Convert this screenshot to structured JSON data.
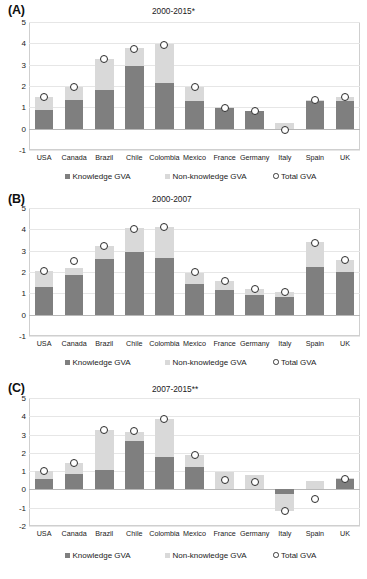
{
  "figure": {
    "panels": [
      {
        "letter": "(A)",
        "title": "2000-2015*",
        "y_ticks": [
          "5",
          "4",
          "3",
          "2",
          "1",
          "0",
          "-1"
        ],
        "ylim": [
          -1,
          5
        ],
        "legend": [
          {
            "label": "Knowledge GVA",
            "swatch": "knowledge",
            "color": "#7f7f7f"
          },
          {
            "label": "Non-knowledge GVA",
            "swatch": "nonknowledge",
            "color": "#d9d9d9"
          },
          {
            "label": "Total GVA",
            "swatch": "total",
            "color": "#ffffff"
          }
        ]
      },
      {
        "letter": "(B)",
        "title": "2000-2007",
        "y_ticks": [
          "5",
          "4",
          "3",
          "2",
          "1",
          "0",
          "-1"
        ],
        "ylim": [
          -1,
          5
        ],
        "legend": [
          {
            "label": "Knowledge GVA",
            "swatch": "knowledge",
            "color": "#7f7f7f"
          },
          {
            "label": "Non-knowledge GVA",
            "swatch": "nonknowledge",
            "color": "#d9d9d9"
          },
          {
            "label": "Total GVA",
            "swatch": "total",
            "color": "#ffffff"
          }
        ]
      },
      {
        "letter": "(C)",
        "title": "2007-2015**",
        "y_ticks": [
          "5",
          "4",
          "3",
          "2",
          "1",
          "0",
          "-1",
          "-2"
        ],
        "ylim": [
          -2,
          5
        ],
        "legend": [
          {
            "label": "Knowledge GVA",
            "swatch": "knowledge",
            "color": "#7f7f7f"
          },
          {
            "label": "Non-knowledge GVA",
            "swatch": "nonknowledge",
            "color": "#d9d9d9"
          },
          {
            "label": "Total GVA",
            "swatch": "total",
            "color": "#ffffff"
          }
        ]
      }
    ]
  },
  "chart_data": [
    {
      "type": "bar",
      "title": "2000-2015*",
      "panel": "(A)",
      "xlabel": "",
      "ylabel": "",
      "ylim": [
        -1,
        5
      ],
      "yticks": [
        -1,
        0,
        1,
        2,
        3,
        4,
        5
      ],
      "grid": true,
      "stacked": true,
      "legend_position": "bottom",
      "categories": [
        "USA",
        "Canada",
        "Brazil",
        "Chile",
        "Colombia",
        "Mexico",
        "France",
        "Germany",
        "Italy",
        "Spain",
        "UK"
      ],
      "series": [
        {
          "name": "Knowledge GVA",
          "color": "#7f7f7f",
          "values": [
            0.87,
            1.33,
            1.79,
            2.94,
            2.12,
            1.32,
            0.97,
            0.82,
            0.0,
            1.31,
            1.3
          ]
        },
        {
          "name": "Non-knowledge GVA",
          "color": "#d9d9d9",
          "values": [
            0.62,
            0.62,
            1.48,
            0.83,
            1.84,
            0.63,
            0.03,
            0.0,
            0.25,
            0.03,
            0.18
          ]
        },
        {
          "name": "Total GVA",
          "color": "#ffffff",
          "type": "scatter",
          "marker": "circle",
          "values": [
            1.48,
            1.95,
            3.27,
            3.75,
            3.94,
            1.96,
            0.95,
            0.82,
            -0.08,
            1.35,
            1.47
          ]
        }
      ]
    },
    {
      "type": "bar",
      "title": "2000-2007",
      "panel": "(B)",
      "xlabel": "",
      "ylabel": "",
      "ylim": [
        -1,
        5
      ],
      "yticks": [
        -1,
        0,
        1,
        2,
        3,
        4,
        5
      ],
      "grid": true,
      "stacked": true,
      "legend_position": "bottom",
      "categories": [
        "USA",
        "Canada",
        "Brazil",
        "Chile",
        "Colombia",
        "Mexico",
        "France",
        "Germany",
        "Italy",
        "Spain",
        "UK"
      ],
      "series": [
        {
          "name": "Knowledge GVA",
          "color": "#7f7f7f",
          "values": [
            1.3,
            1.86,
            2.59,
            2.96,
            2.64,
            1.44,
            1.17,
            0.93,
            0.85,
            2.23,
            1.99
          ]
        },
        {
          "name": "Non-knowledge GVA",
          "color": "#d9d9d9",
          "values": [
            0.75,
            0.35,
            0.62,
            1.09,
            1.45,
            0.52,
            0.4,
            0.27,
            0.2,
            1.18,
            0.56
          ]
        },
        {
          "name": "Total GVA",
          "color": "#ffffff",
          "type": "scatter",
          "marker": "circle",
          "values": [
            2.05,
            2.5,
            3.23,
            4.0,
            4.1,
            2.0,
            1.58,
            1.22,
            1.08,
            3.38,
            2.55
          ]
        }
      ]
    },
    {
      "type": "bar",
      "title": "2007-2015**",
      "panel": "(C)",
      "xlabel": "",
      "ylabel": "",
      "ylim": [
        -2,
        5
      ],
      "yticks": [
        -2,
        -1,
        0,
        1,
        2,
        3,
        4,
        5
      ],
      "grid": true,
      "stacked": true,
      "legend_position": "bottom",
      "categories": [
        "USA",
        "Canada",
        "Brazil",
        "Chile",
        "Colombia",
        "Mexico",
        "France",
        "Germany",
        "Italy",
        "Spain",
        "UK"
      ],
      "series": [
        {
          "name": "Knowledge GVA",
          "color": "#7f7f7f",
          "values": [
            0.55,
            0.84,
            1.08,
            2.66,
            1.76,
            1.24,
            0.0,
            0.0,
            -0.25,
            0.0,
            0.55
          ]
        },
        {
          "name": "Non-knowledge GVA",
          "color": "#d9d9d9",
          "values": [
            0.45,
            0.62,
            2.18,
            0.5,
            2.09,
            0.62,
            0.95,
            0.8,
            -0.95,
            0.45,
            0.1
          ]
        },
        {
          "name": "Total GVA",
          "color": "#ffffff",
          "type": "scatter",
          "marker": "circle",
          "values": [
            1.02,
            1.45,
            3.25,
            3.17,
            3.85,
            1.87,
            0.5,
            0.42,
            -1.2,
            -0.52,
            0.55
          ]
        }
      ]
    }
  ]
}
